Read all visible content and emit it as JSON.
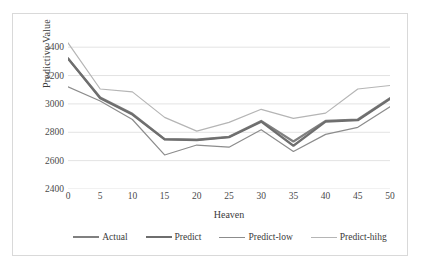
{
  "chart_data": {
    "type": "line",
    "title": "",
    "xlabel": "Heaven",
    "ylabel": "Predictive Value",
    "x": [
      0,
      5,
      10,
      15,
      20,
      25,
      30,
      35,
      40,
      45,
      50
    ],
    "xlim": [
      0,
      50
    ],
    "ylim": [
      2400,
      3500
    ],
    "yticks": [
      2400,
      2600,
      2800,
      3000,
      3200,
      3400
    ],
    "xticks": [
      0,
      5,
      10,
      15,
      20,
      25,
      30,
      35,
      40,
      45,
      50
    ],
    "grid": "horizontal",
    "legend_position": "bottom",
    "series": [
      {
        "name": "Actual",
        "color": "#808080",
        "width": 2.2,
        "values": [
          3320,
          3045,
          2930,
          2752,
          2748,
          2768,
          2880,
          2735,
          2880,
          2890,
          3040
        ]
      },
      {
        "name": "Predict",
        "color": "#6e6e6e",
        "width": 2.2,
        "values": [
          3320,
          3040,
          2925,
          2750,
          2745,
          2765,
          2875,
          2705,
          2875,
          2885,
          3035
        ]
      },
      {
        "name": "Predict-low",
        "color": "#8c8c8c",
        "width": 1.2,
        "values": [
          3120,
          3020,
          2890,
          2640,
          2710,
          2695,
          2818,
          2665,
          2785,
          2835,
          2980
        ]
      },
      {
        "name": "Predict-hihg",
        "color": "#b5b5b5",
        "width": 1.2,
        "values": [
          3430,
          3105,
          3085,
          2905,
          2808,
          2870,
          2962,
          2898,
          2935,
          3105,
          3130
        ]
      }
    ]
  },
  "axis": {
    "y_title": "Predictive Value",
    "x_title": "Heaven",
    "y_tick_labels": [
      "3400",
      "3200",
      "3000",
      "2800",
      "2600",
      "2400"
    ],
    "x_tick_labels": [
      "0",
      "5",
      "10",
      "15",
      "20",
      "25",
      "30",
      "35",
      "40",
      "45",
      "50"
    ]
  },
  "legend": {
    "items": [
      {
        "label": "Actual",
        "color": "#808080"
      },
      {
        "label": "Predict",
        "color": "#6e6e6e"
      },
      {
        "label": "Predict-low",
        "color": "#8c8c8c"
      },
      {
        "label": "Predict-hihg",
        "color": "#b5b5b5"
      }
    ]
  },
  "style": {
    "grid_color": "#e3e3e3",
    "frame_color": "#d9d9d9",
    "background": "#ffffff",
    "text_color": "#3a3a3a"
  }
}
